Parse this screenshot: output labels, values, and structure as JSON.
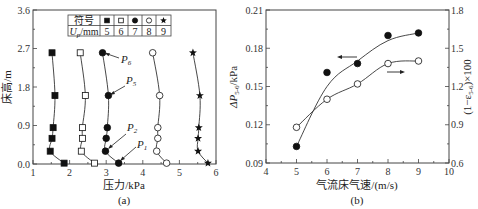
{
  "chart_data": [
    {
      "type": "line",
      "caption": "(a)",
      "xlabel": "压力/kPa",
      "ylabel": "床高/m",
      "xlim": [
        1,
        6
      ],
      "ylim": [
        0,
        3.6
      ],
      "xticks": [
        "1",
        "2",
        "3",
        "4",
        "5",
        "6"
      ],
      "yticks": [
        "0.0",
        "0.9",
        "1.8",
        "2.7",
        "3.6"
      ],
      "grid": false,
      "legend_table": {
        "header_label": "符号",
        "row_label": "Up/mm",
        "symbols": [
          "filled-square",
          "open-square",
          "filled-circle",
          "open-circle",
          "filled-star"
        ],
        "values": [
          "5",
          "6",
          "7",
          "8",
          "9"
        ]
      },
      "y": [
        0.02,
        0.3,
        0.6,
        0.85,
        1.6,
        2.6
      ],
      "series": [
        {
          "name": "Up=5mm",
          "marker": "filled-square",
          "x": [
            1.85,
            1.47,
            1.52,
            1.55,
            1.6,
            1.52
          ]
        },
        {
          "name": "Up=6mm",
          "marker": "open-square",
          "x": [
            2.68,
            2.32,
            2.35,
            2.35,
            2.43,
            2.29
          ]
        },
        {
          "name": "Up=7mm",
          "marker": "filled-circle",
          "x": [
            3.34,
            2.98,
            3.0,
            3.03,
            3.06,
            2.9
          ]
        },
        {
          "name": "Up=8mm",
          "marker": "open-circle",
          "x": [
            4.65,
            4.38,
            4.41,
            4.41,
            4.46,
            4.27
          ]
        },
        {
          "name": "Up=9mm",
          "marker": "filled-star",
          "x": [
            5.78,
            5.51,
            5.51,
            5.53,
            5.56,
            5.37
          ]
        }
      ],
      "annotations": [
        {
          "text": "P1",
          "target": "Up=7mm, y=0.02"
        },
        {
          "text": "P2",
          "target": "Up=7mm, y=0.3"
        },
        {
          "text": "P5",
          "target": "Up=7mm, y=1.6"
        },
        {
          "text": "P6",
          "target": "Up=7mm, y=2.6"
        }
      ]
    },
    {
      "type": "line",
      "caption": "(b)",
      "xlabel": "气流床气速/(m/s)",
      "ylabel_left": "ΔP5-6/kPa",
      "ylabel_right": "(1−ε5-6)×100",
      "xlim": [
        4,
        10
      ],
      "ylim_left": [
        0.09,
        0.21
      ],
      "ylim_right": [
        0.6,
        1.8
      ],
      "xticks": [
        "4",
        "5",
        "6",
        "7",
        "8",
        "9",
        "10"
      ],
      "yticks_left": [
        "0.09",
        "0.12",
        "0.15",
        "0.18",
        "0.21"
      ],
      "yticks_right": [
        "0.6",
        "0.9",
        "1.2",
        "1.5",
        "1.8"
      ],
      "grid": false,
      "x": [
        5,
        6,
        7,
        8,
        9
      ],
      "series": [
        {
          "name": "ΔP5-6",
          "axis": "left",
          "marker": "filled-circle",
          "values": [
            0.103,
            0.161,
            0.168,
            0.19,
            0.192
          ]
        },
        {
          "name": "(1−ε5-6)×100",
          "axis": "right",
          "marker": "open-circle",
          "values": [
            0.88,
            1.1,
            1.22,
            1.38,
            1.4
          ]
        }
      ],
      "annotations": [
        {
          "text": "←",
          "meaning": "filled series refers to left axis"
        },
        {
          "text": "→",
          "meaning": "open series refers to right axis"
        }
      ]
    }
  ],
  "labels": {
    "a": {
      "caption": "(a)",
      "xlabel": "压力/kPa",
      "ylabel": "床高/m",
      "legend_header": "符号",
      "legend_row_U": "U",
      "legend_row_sub": "p",
      "legend_row_unit": "/mm",
      "legend_values": [
        "5",
        "6",
        "7",
        "8",
        "9"
      ],
      "p1": "P",
      "p1s": "1",
      "p2": "P",
      "p2s": "2",
      "p5": "P",
      "p5s": "5",
      "p6": "P",
      "p6s": "6"
    },
    "b": {
      "caption": "(b)",
      "xlabel": "气流床气速/(m/s)",
      "ylabel_left": "ΔP",
      "ylabel_left_sub": "5-6",
      "ylabel_left_unit": "/kPa",
      "ylabel_right_a": "(1−ε",
      "ylabel_right_sub": "5-6",
      "ylabel_right_b": ")×100"
    }
  }
}
